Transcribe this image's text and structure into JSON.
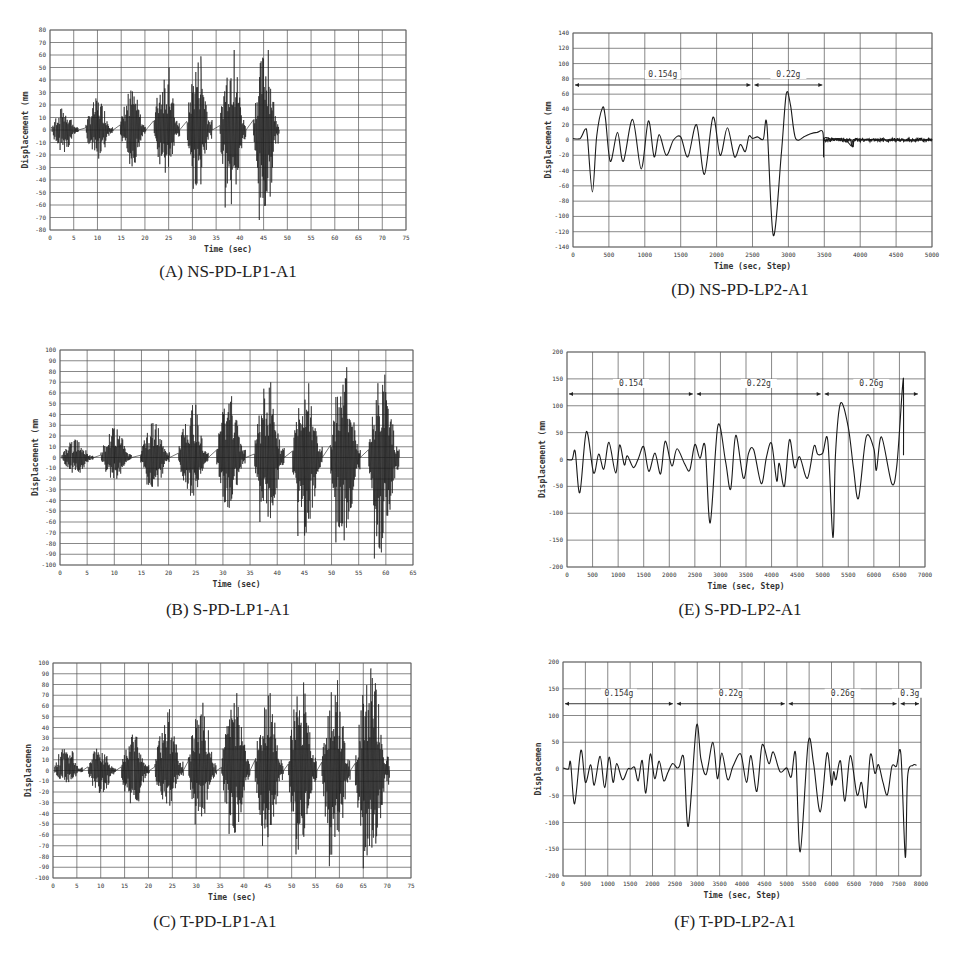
{
  "chart_data": [
    {
      "id": "A",
      "type": "line",
      "caption": "(A) NS-PD-LP1-A1",
      "xlabel": "Time (sec)",
      "ylabel": "Displacement (mm",
      "xlim": [
        0,
        75
      ],
      "ylim": [
        -80,
        80
      ],
      "xticks": [
        0,
        5,
        10,
        15,
        20,
        25,
        30,
        35,
        40,
        45,
        50,
        55,
        60,
        65,
        70,
        75
      ],
      "yticks": [
        80,
        70,
        60,
        50,
        40,
        30,
        20,
        10,
        0,
        -10,
        -20,
        -30,
        -40,
        -50,
        -60,
        -70,
        -80
      ],
      "grid": true,
      "bursts": [
        {
          "start": 0.3,
          "end": 6,
          "max": 18,
          "min": -18
        },
        {
          "start": 7.5,
          "end": 13.3,
          "max": 26,
          "min": -25
        },
        {
          "start": 14.8,
          "end": 20.2,
          "max": 34,
          "min": -30
        },
        {
          "start": 21.8,
          "end": 27.3,
          "max": 50,
          "min": -37
        },
        {
          "start": 28.8,
          "end": 34.2,
          "max": 59,
          "min": -48
        },
        {
          "start": 35.8,
          "end": 41.3,
          "max": 64,
          "min": -62
        },
        {
          "start": 42.8,
          "end": 48.3,
          "max": 64,
          "min": -72
        }
      ],
      "peaks": [
        {
          "x": 25.1,
          "y": 50
        },
        {
          "x": 31.8,
          "y": 59
        },
        {
          "x": 38.8,
          "y": 64
        },
        {
          "x": 46,
          "y": 64
        },
        {
          "x": 36.9,
          "y": -62
        },
        {
          "x": 44.1,
          "y": -72
        },
        {
          "x": 30.2,
          "y": -47
        },
        {
          "x": 45.3,
          "y": -57
        }
      ],
      "box": {
        "left": 50,
        "top": 30,
        "right": 406,
        "bottom": 230
      },
      "caption_pos": {
        "x": 228,
        "y": 276
      }
    },
    {
      "id": "B",
      "type": "line",
      "caption": "(B) S-PD-LP1-A1",
      "xlabel": "Time (sec)",
      "ylabel": "Displacement (mm",
      "xlim": [
        0,
        65
      ],
      "ylim": [
        -100,
        100
      ],
      "xticks": [
        0,
        5,
        10,
        15,
        20,
        25,
        30,
        35,
        40,
        45,
        50,
        55,
        60,
        65
      ],
      "yticks": [
        100,
        90,
        80,
        70,
        60,
        50,
        40,
        30,
        20,
        10,
        0,
        -10,
        -20,
        -30,
        -40,
        -50,
        -60,
        -70,
        -80,
        -90,
        -100
      ],
      "grid": true,
      "bursts": [
        {
          "start": 0.3,
          "end": 6.2,
          "max": 17,
          "min": -16
        },
        {
          "start": 7.5,
          "end": 13.2,
          "max": 28,
          "min": -22
        },
        {
          "start": 14.8,
          "end": 20.2,
          "max": 33,
          "min": -33
        },
        {
          "start": 21.8,
          "end": 27.3,
          "max": 50,
          "min": -37
        },
        {
          "start": 28.8,
          "end": 34.2,
          "max": 58,
          "min": -48
        },
        {
          "start": 35.8,
          "end": 41.3,
          "max": 70,
          "min": -60
        },
        {
          "start": 42.8,
          "end": 48.3,
          "max": 70,
          "min": -73
        },
        {
          "start": 49.8,
          "end": 55.3,
          "max": 84,
          "min": -79
        },
        {
          "start": 56.8,
          "end": 62.5,
          "max": 77,
          "min": -94
        }
      ],
      "peaks": [
        {
          "x": 25,
          "y": 49
        },
        {
          "x": 31.6,
          "y": 57
        },
        {
          "x": 38.8,
          "y": 70
        },
        {
          "x": 45.8,
          "y": 69
        },
        {
          "x": 52.8,
          "y": 84
        },
        {
          "x": 59.8,
          "y": 77
        },
        {
          "x": 36.8,
          "y": -60
        },
        {
          "x": 43.8,
          "y": -73
        },
        {
          "x": 50.8,
          "y": -79
        },
        {
          "x": 57.9,
          "y": -94
        },
        {
          "x": 59.4,
          "y": -75
        }
      ],
      "box": {
        "left": 60,
        "top": 350,
        "right": 413,
        "bottom": 565
      },
      "caption_pos": {
        "x": 228,
        "y": 614
      }
    },
    {
      "id": "C",
      "type": "line",
      "caption": "(C) T-PD-LP1-A1",
      "xlabel": "Time (sec)",
      "ylabel": "Displacemen",
      "xlim": [
        0,
        75
      ],
      "ylim": [
        -100,
        100
      ],
      "xticks": [
        0,
        5,
        10,
        15,
        20,
        25,
        30,
        35,
        40,
        45,
        50,
        55,
        60,
        65,
        70,
        75
      ],
      "yticks": [
        100,
        90,
        80,
        70,
        60,
        50,
        40,
        30,
        20,
        10,
        0,
        -10,
        -20,
        -30,
        -40,
        -50,
        -60,
        -70,
        -80,
        -90,
        -100
      ],
      "grid": true,
      "bursts": [
        {
          "start": 0.2,
          "end": 6.2,
          "max": 24,
          "min": -12
        },
        {
          "start": 7.3,
          "end": 13.2,
          "max": 24,
          "min": -25
        },
        {
          "start": 14.3,
          "end": 20.2,
          "max": 34,
          "min": -37
        },
        {
          "start": 21.3,
          "end": 27.3,
          "max": 57,
          "min": -35
        },
        {
          "start": 28.3,
          "end": 34.3,
          "max": 63,
          "min": -50
        },
        {
          "start": 35.3,
          "end": 41.3,
          "max": 72,
          "min": -59
        },
        {
          "start": 42.3,
          "end": 48.3,
          "max": 72,
          "min": -70
        },
        {
          "start": 49.3,
          "end": 55.3,
          "max": 82,
          "min": -78
        },
        {
          "start": 56.3,
          "end": 62.3,
          "max": 84,
          "min": -89
        },
        {
          "start": 63.3,
          "end": 70.5,
          "max": 95,
          "min": -91
        }
      ],
      "peaks": [
        {
          "x": 24.4,
          "y": 57
        },
        {
          "x": 31.4,
          "y": 63
        },
        {
          "x": 38.5,
          "y": 72
        },
        {
          "x": 45.5,
          "y": 72
        },
        {
          "x": 52.5,
          "y": 82
        },
        {
          "x": 59.6,
          "y": 84
        },
        {
          "x": 66.6,
          "y": 95
        },
        {
          "x": 29.8,
          "y": -50
        },
        {
          "x": 36.9,
          "y": -59
        },
        {
          "x": 43.9,
          "y": -70
        },
        {
          "x": 50.9,
          "y": -78
        },
        {
          "x": 57.9,
          "y": -89
        },
        {
          "x": 65,
          "y": -91
        }
      ],
      "box": {
        "left": 53,
        "top": 663,
        "right": 411,
        "bottom": 878
      },
      "caption_pos": {
        "x": 215,
        "y": 926
      }
    },
    {
      "id": "D",
      "type": "line",
      "caption": "(D) NS-PD-LP2-A1",
      "xlabel": "Time (sec, Step)",
      "ylabel": "Displacement (mm",
      "xlim": [
        0,
        5000
      ],
      "ylim": [
        -140,
        140
      ],
      "xticks": [
        0,
        500,
        1000,
        1500,
        2000,
        2500,
        3000,
        3500,
        4000,
        4500,
        5000
      ],
      "yticks": [
        140,
        120,
        100,
        80,
        60,
        40,
        20,
        0,
        -20,
        -40,
        -60,
        -80,
        -100,
        -120,
        -140
      ],
      "grid": true,
      "annotations": [
        {
          "label": "0.154g",
          "x_start": 0,
          "x_end": 2500,
          "y": 72
        },
        {
          "label": "0.22g",
          "x_start": 2500,
          "x_end": 3500,
          "y": 72
        }
      ],
      "x": [
        0,
        100,
        170,
        200,
        270,
        330,
        410,
        450,
        520,
        620,
        700,
        830,
        950,
        1050,
        1130,
        1200,
        1300,
        1400,
        1500,
        1600,
        1720,
        1830,
        1950,
        2050,
        2150,
        2250,
        2330,
        2400,
        2450,
        2500,
        2570,
        2650,
        2700,
        2790,
        2900,
        2970,
        3030,
        3100,
        3230,
        3300,
        3400,
        3480,
        3490,
        3500,
        3600,
        3700,
        3800,
        3880,
        3900,
        4000,
        4500,
        5000
      ],
      "y": [
        2,
        2,
        14,
        5,
        -68,
        5,
        42,
        30,
        -28,
        10,
        -28,
        27,
        -38,
        25,
        -22,
        7,
        -20,
        0,
        4,
        -22,
        20,
        -45,
        30,
        -20,
        16,
        -22,
        -6,
        -15,
        5,
        2,
        4,
        1,
        20,
        -125,
        -20,
        60,
        45,
        2,
        5,
        8,
        10,
        10,
        -22,
        2,
        1,
        2,
        0,
        -8,
        0,
        1,
        0,
        0
      ],
      "box": {
        "left": 573,
        "top": 33,
        "right": 932,
        "bottom": 247
      },
      "caption_pos": {
        "x": 740,
        "y": 294
      }
    },
    {
      "id": "E",
      "type": "line",
      "caption": "(E) S-PD-LP2-A1",
      "xlabel": "Time (sec, Step)",
      "ylabel": "Displacement (mm",
      "xlim": [
        0,
        7000
      ],
      "ylim": [
        -200,
        200
      ],
      "xticks": [
        0,
        500,
        1000,
        1500,
        2000,
        2500,
        3000,
        3500,
        4000,
        4500,
        5000,
        5500,
        6000,
        6500,
        7000
      ],
      "yticks": [
        200,
        150,
        100,
        50,
        0,
        -50,
        -100,
        -150,
        -200
      ],
      "grid": true,
      "annotations": [
        {
          "label": "0.154",
          "x_start": 0,
          "x_end": 2500,
          "y": 122
        },
        {
          "label": "0.22g",
          "x_start": 2500,
          "x_end": 5000,
          "y": 122
        },
        {
          "label": "0.26g",
          "x_start": 5000,
          "x_end": 6900,
          "y": 122
        }
      ],
      "x": [
        0,
        100,
        160,
        250,
        380,
        520,
        620,
        720,
        820,
        950,
        1030,
        1120,
        1180,
        1300,
        1400,
        1500,
        1600,
        1720,
        1830,
        1920,
        2050,
        2150,
        2300,
        2400,
        2500,
        2600,
        2700,
        2800,
        2950,
        3100,
        3200,
        3300,
        3450,
        3550,
        3650,
        3800,
        3900,
        4000,
        4100,
        4150,
        4250,
        4350,
        4450,
        4550,
        4700,
        4830,
        4900,
        5000,
        5100,
        5200,
        5250,
        5350,
        5500,
        5600,
        5700,
        5850,
        6000,
        6050,
        6150,
        6350,
        6450,
        6560,
        6580,
        6580
      ],
      "y": [
        0,
        0,
        15,
        -62,
        52,
        -25,
        10,
        -18,
        32,
        -25,
        27,
        -10,
        7,
        -15,
        3,
        24,
        -22,
        12,
        -27,
        34,
        -12,
        20,
        -8,
        -20,
        28,
        2,
        25,
        -118,
        63,
        -3,
        -55,
        45,
        -35,
        12,
        18,
        -45,
        5,
        30,
        -40,
        -7,
        -50,
        37,
        -15,
        5,
        -35,
        25,
        10,
        12,
        35,
        -145,
        10,
        105,
        60,
        -15,
        -72,
        42,
        20,
        -20,
        42,
        -45,
        -10,
        135,
        135,
        8
      ],
      "box": {
        "left": 567,
        "top": 352,
        "right": 925,
        "bottom": 567
      },
      "caption_pos": {
        "x": 740,
        "y": 614
      }
    },
    {
      "id": "F",
      "type": "line",
      "caption": "(F) T-PD-LP2-A1",
      "xlabel": "Time (sec, Step)",
      "ylabel": "Displacemen",
      "xlim": [
        0,
        8000
      ],
      "ylim": [
        -200,
        200
      ],
      "xticks": [
        0,
        500,
        1000,
        1500,
        2000,
        2500,
        3000,
        3500,
        4000,
        4500,
        5000,
        5500,
        6000,
        6500,
        7000,
        7500,
        8000
      ],
      "yticks": [
        200,
        150,
        100,
        50,
        0,
        -50,
        -100,
        -150,
        -200
      ],
      "grid": true,
      "annotations": [
        {
          "label": "0.154g",
          "x_start": 0,
          "x_end": 2500,
          "y": 122
        },
        {
          "label": "0.22g",
          "x_start": 2500,
          "x_end": 5000,
          "y": 122
        },
        {
          "label": "0.26g",
          "x_start": 5000,
          "x_end": 7500,
          "y": 122
        },
        {
          "label": "0.3g",
          "x_start": 7500,
          "x_end": 8000,
          "y": 122
        }
      ],
      "x": [
        0,
        120,
        170,
        260,
        400,
        500,
        620,
        700,
        830,
        930,
        1030,
        1120,
        1200,
        1330,
        1450,
        1520,
        1600,
        1680,
        1770,
        1850,
        1950,
        2050,
        2150,
        2250,
        2350,
        2450,
        2550,
        2600,
        2700,
        2800,
        2980,
        3080,
        3200,
        3350,
        3450,
        3550,
        3680,
        3800,
        3970,
        4100,
        4200,
        4330,
        4450,
        4600,
        4700,
        4850,
        5000,
        5100,
        5200,
        5300,
        5480,
        5600,
        5750,
        5900,
        6000,
        6050,
        6100,
        6200,
        6300,
        6420,
        6570,
        6670,
        6770,
        6870,
        6970,
        7050,
        7150,
        7250,
        7350,
        7450,
        7550,
        7650,
        7700,
        7820,
        7900
      ],
      "y": [
        2,
        0,
        12,
        -65,
        35,
        -25,
        8,
        -30,
        24,
        -35,
        22,
        -25,
        10,
        -20,
        0,
        0,
        3,
        -22,
        16,
        -45,
        28,
        -18,
        15,
        -22,
        -5,
        10,
        2,
        5,
        20,
        -107,
        80,
        20,
        -10,
        50,
        -18,
        30,
        -20,
        5,
        28,
        -25,
        25,
        -42,
        45,
        10,
        32,
        -5,
        2,
        -15,
        28,
        -155,
        50,
        10,
        -80,
        30,
        -30,
        -5,
        -20,
        15,
        -60,
        25,
        -48,
        -25,
        -72,
        27,
        -8,
        8,
        -25,
        -48,
        5,
        5,
        28,
        -165,
        -15,
        7,
        7
      ],
      "box": {
        "left": 563,
        "top": 662,
        "right": 921,
        "bottom": 876
      },
      "caption_pos": {
        "x": 735,
        "y": 926
      }
    }
  ]
}
